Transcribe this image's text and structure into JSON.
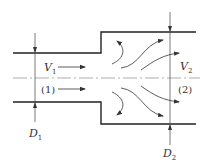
{
  "diagram": {
    "type": "sudden-expansion-pipe-flow",
    "labels": {
      "v1": "V",
      "v1_sub": "1",
      "v2": "V",
      "v2_sub": "2",
      "section1": "(1)",
      "section2": "(2)",
      "d1": "D",
      "d1_sub": "1",
      "d2": "D",
      "d2_sub": "2"
    },
    "colors": {
      "wall": "#222222",
      "dimension": "#444444",
      "centerline": "#777777",
      "flow": "#333333"
    }
  }
}
